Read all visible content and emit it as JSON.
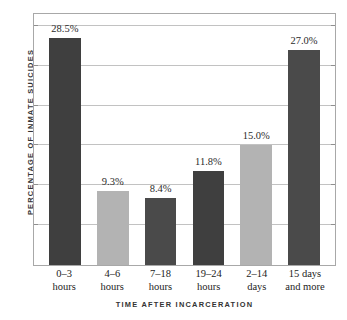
{
  "chart_data": {
    "type": "bar",
    "title": "",
    "xlabel": "TIME AFTER INCARCERATION",
    "ylabel": "PERCENTAGE OF INMATE SUICIDES",
    "categories": [
      "0–3 hours",
      "4–6 hours",
      "7–18 hours",
      "19–24 hours",
      "2–14 days",
      "15 days and more"
    ],
    "category_lines": [
      [
        "0–3",
        "hours"
      ],
      [
        "4–6",
        "hours"
      ],
      [
        "7–18",
        "hours"
      ],
      [
        "19–24",
        "hours"
      ],
      [
        "2–14",
        "days"
      ],
      [
        "15 days",
        "and more"
      ]
    ],
    "values": [
      28.5,
      9.3,
      8.4,
      11.8,
      15.0,
      27.0
    ],
    "value_labels": [
      "28.5%",
      "9.3%",
      "8.4%",
      "11.8%",
      "15.0%",
      "27.0%"
    ],
    "bar_colors": [
      "#3f3f3f",
      "#b3b3b3",
      "#4a4a4a",
      "#3f3f3f",
      "#b3b3b3",
      "#4a4a4a"
    ],
    "ylim": [
      0,
      31.5
    ],
    "grid": true,
    "gridline_interval": 5,
    "gridline_values": [
      5,
      10,
      15,
      20,
      25,
      30
    ],
    "legend": "none",
    "axis_tick_labels_visible": false,
    "colors": {
      "frame": "#a8a8a8",
      "gridline": "#c2c2c2",
      "tick": "#8f8f8f",
      "axis_title": "#333333",
      "label_text": "#232323",
      "background": "#ffffff"
    }
  }
}
